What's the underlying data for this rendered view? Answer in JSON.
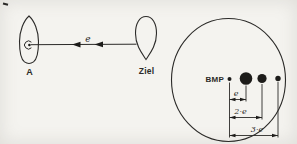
{
  "figure": {
    "left_setup": {
      "source_label": "A",
      "target_label": "Ziel",
      "beam_label": "e"
    },
    "right_view": {
      "reference_label": "BMP",
      "dim_e_label": "e",
      "dim_2e_label": "2·e",
      "dim_3e_label": "3·e"
    }
  },
  "colors": {
    "paper": "#f4f3ef",
    "ink": "#2b2a28",
    "dot_fill": "#1d1c1a"
  }
}
